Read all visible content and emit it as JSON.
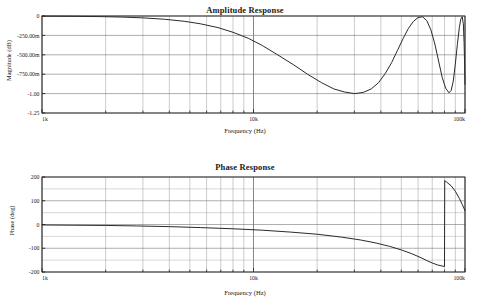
{
  "chart_data": [
    {
      "type": "line",
      "name": "amplitude-response",
      "title": "Amplitude Response",
      "xlabel": "Frequency (Hz)",
      "ylabel": "Magnitude  (dB)",
      "xscale": "log",
      "xlim": [
        1000,
        100000
      ],
      "ylim": [
        -1.25,
        0
      ],
      "grid": true,
      "legend": null,
      "xtick_labels": [
        "1k",
        "10k",
        "100k"
      ],
      "xtick_values": [
        1000,
        10000,
        100000
      ],
      "ytick_labels": [
        "0",
        "-250.00m",
        "-500.00m",
        "-750.00m",
        "-1.00",
        "-1.25"
      ],
      "ytick_values": [
        0,
        -0.25,
        -0.5,
        -0.75,
        -1.0,
        -1.25
      ],
      "series": [
        {
          "name": "magnitude",
          "color": "#2a2a2a",
          "x": [
            1000,
            1200,
            1500,
            1900,
            2400,
            3000,
            3800,
            4700,
            5600,
            6800,
            8000,
            9500,
            11000,
            13000,
            15500,
            18000,
            21000,
            24000,
            27000,
            30000,
            33000,
            36000,
            39000,
            42000,
            45000,
            48000,
            51000,
            54000,
            57000,
            60000,
            63000,
            66000,
            69000,
            72000,
            75000,
            78000,
            81000,
            84000,
            86000,
            88000,
            90000,
            92000,
            94000,
            95500,
            97000,
            98200,
            99000,
            99600,
            100000
          ],
          "y": [
            -0.002,
            -0.003,
            -0.005,
            -0.008,
            -0.014,
            -0.024,
            -0.042,
            -0.068,
            -0.1,
            -0.15,
            -0.21,
            -0.29,
            -0.38,
            -0.5,
            -0.63,
            -0.75,
            -0.86,
            -0.94,
            -0.98,
            -1.0,
            -0.985,
            -0.94,
            -0.86,
            -0.74,
            -0.6,
            -0.44,
            -0.29,
            -0.16,
            -0.07,
            -0.02,
            -0.01,
            -0.06,
            -0.18,
            -0.36,
            -0.58,
            -0.79,
            -0.93,
            -0.99,
            -0.96,
            -0.84,
            -0.62,
            -0.37,
            -0.15,
            -0.04,
            -0.01,
            -0.1,
            -0.34,
            -0.63,
            -0.88
          ]
        }
      ]
    },
    {
      "type": "line",
      "name": "phase-response",
      "title": "Phase Response",
      "xlabel": "Frequency (Hz)",
      "ylabel": "Phase  (deg)",
      "xscale": "log",
      "xlim": [
        1000,
        100000
      ],
      "ylim": [
        -200,
        200
      ],
      "grid": true,
      "legend": null,
      "xtick_labels": [
        "1k",
        "10k",
        "100k"
      ],
      "xtick_values": [
        1000,
        10000,
        100000
      ],
      "ytick_labels": [
        "200",
        "100",
        "0",
        "-100",
        "-200"
      ],
      "ytick_values": [
        200,
        100,
        0,
        -100,
        -200
      ],
      "series": [
        {
          "name": "phase",
          "color": "#2a2a2a",
          "x": [
            1000,
            1400,
            2000,
            2800,
            4000,
            5600,
            8000,
            11000,
            15000,
            20000,
            26000,
            32000,
            38000,
            44000,
            50000,
            56000,
            62000,
            66000,
            70000,
            74000,
            78000,
            80000,
            80200,
            82000,
            86000,
            90000,
            94000,
            97000,
            100000
          ],
          "y": [
            -2,
            -3,
            -4,
            -6,
            -9,
            -13,
            -18,
            -24,
            -32,
            -41,
            -53,
            -65,
            -78,
            -92,
            -107,
            -123,
            -140,
            -152,
            -162,
            -170,
            -175,
            -177,
            185,
            178,
            163,
            140,
            110,
            85,
            58
          ]
        }
      ]
    }
  ]
}
